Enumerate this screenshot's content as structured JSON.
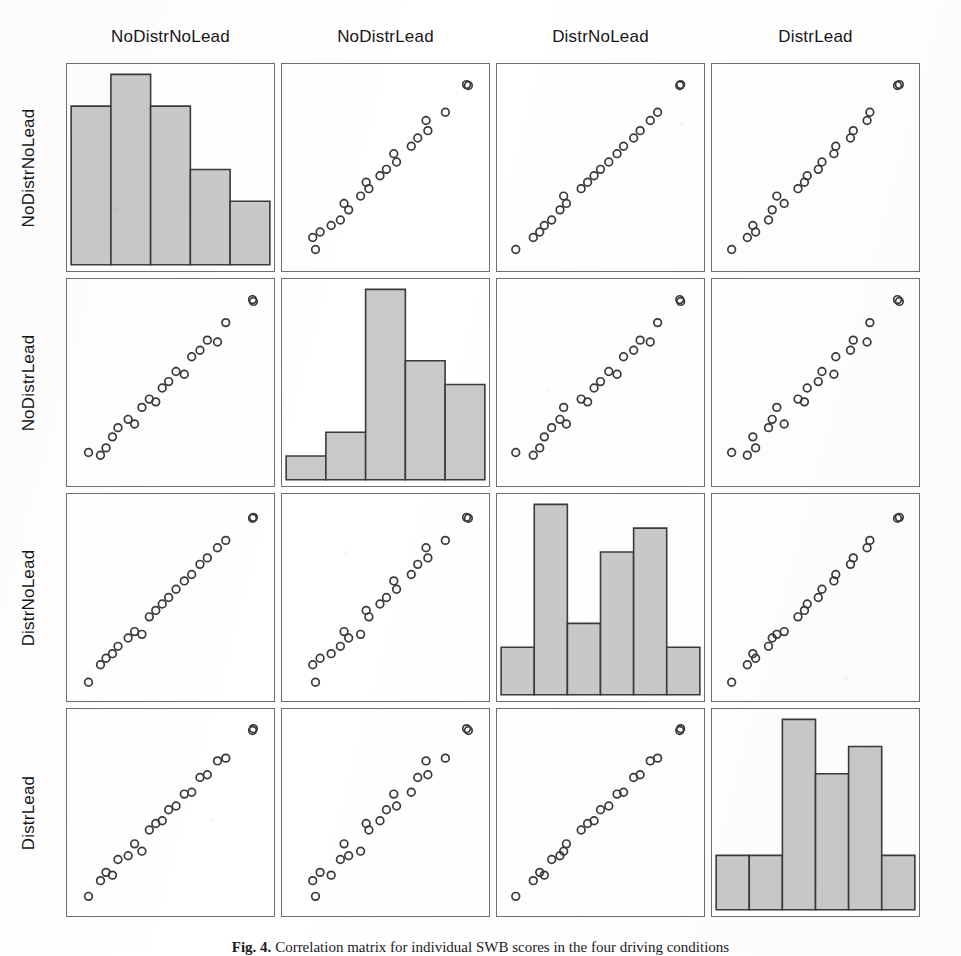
{
  "figure": {
    "caption_label": "Fig. 4.",
    "caption_text": "Correlation matrix for individual SWB scores in the four driving conditions",
    "variables": [
      "NoDistrNoLead",
      "NoDistrLead",
      "DistrNoLead",
      "DistrLead"
    ],
    "colors": {
      "bar_fill": "#c9c9c9",
      "bar_stroke": "#3b3b3b",
      "marker_stroke": "#3a3a3a",
      "panel_border": "#6f6f6f",
      "background": "#ffffff",
      "text": "#161616"
    }
  },
  "column_headers": [
    {
      "label": "NoDistrNoLead"
    },
    {
      "label": "NoDistrLead"
    },
    {
      "label": "DistrNoLead"
    },
    {
      "label": "DistrLead"
    }
  ],
  "row_headers": [
    {
      "label": "NoDistrNoLead"
    },
    {
      "label": "NoDistrLead"
    },
    {
      "label": "DistrNoLead"
    },
    {
      "label": "DistrLead"
    }
  ],
  "chart_data": {
    "type": "scatter",
    "subtype": "scatterplot-matrix",
    "title": "Correlation matrix for individual SWB scores in the four driving conditions",
    "xlabel": "",
    "ylabel": "",
    "grid": false,
    "legend": "none",
    "n_rows": 4,
    "n_cols": 4,
    "diagonal": "histogram",
    "n_observations": 21,
    "variables": [
      "NoDistrNoLead",
      "NoDistrLead",
      "DistrNoLead",
      "DistrLead"
    ],
    "axis_range": [
      0,
      1
    ],
    "observations": [
      {
        "NoDistrNoLead": 0.055,
        "NoDistrLead": 0.12,
        "DistrNoLead": 0.04,
        "DistrLead": 0.045
      },
      {
        "NoDistrNoLead": 0.12,
        "NoDistrLead": 0.105,
        "DistrNoLead": 0.135,
        "DistrLead": 0.13
      },
      {
        "NoDistrNoLead": 0.15,
        "NoDistrLead": 0.145,
        "DistrNoLead": 0.17,
        "DistrLead": 0.175
      },
      {
        "NoDistrNoLead": 0.185,
        "NoDistrLead": 0.205,
        "DistrNoLead": 0.195,
        "DistrLead": 0.16
      },
      {
        "NoDistrNoLead": 0.215,
        "NoDistrLead": 0.255,
        "DistrNoLead": 0.235,
        "DistrLead": 0.245
      },
      {
        "NoDistrNoLead": 0.27,
        "NoDistrLead": 0.3,
        "DistrNoLead": 0.28,
        "DistrLead": 0.265
      },
      {
        "NoDistrNoLead": 0.305,
        "NoDistrLead": 0.275,
        "DistrNoLead": 0.315,
        "DistrLead": 0.33
      },
      {
        "NoDistrNoLead": 0.345,
        "NoDistrLead": 0.365,
        "DistrNoLead": 0.3,
        "DistrLead": 0.29
      },
      {
        "NoDistrNoLead": 0.385,
        "NoDistrLead": 0.41,
        "DistrNoLead": 0.395,
        "DistrLead": 0.405
      },
      {
        "NoDistrNoLead": 0.42,
        "NoDistrLead": 0.395,
        "DistrNoLead": 0.43,
        "DistrLead": 0.44
      },
      {
        "NoDistrNoLead": 0.455,
        "NoDistrLead": 0.47,
        "DistrNoLead": 0.465,
        "DistrLead": 0.455
      },
      {
        "NoDistrNoLead": 0.49,
        "NoDistrLead": 0.505,
        "DistrNoLead": 0.5,
        "DistrLead": 0.515
      },
      {
        "NoDistrNoLead": 0.53,
        "NoDistrLead": 0.56,
        "DistrNoLead": 0.545,
        "DistrLead": 0.535
      },
      {
        "NoDistrNoLead": 0.575,
        "NoDistrLead": 0.545,
        "DistrNoLead": 0.59,
        "DistrLead": 0.6
      },
      {
        "NoDistrNoLead": 0.615,
        "NoDistrLead": 0.64,
        "DistrNoLead": 0.625,
        "DistrLead": 0.61
      },
      {
        "NoDistrNoLead": 0.66,
        "NoDistrLead": 0.675,
        "DistrNoLead": 0.68,
        "DistrLead": 0.69
      },
      {
        "NoDistrNoLead": 0.7,
        "NoDistrLead": 0.73,
        "DistrNoLead": 0.715,
        "DistrLead": 0.705
      },
      {
        "NoDistrNoLead": 0.755,
        "NoDistrLead": 0.72,
        "DistrNoLead": 0.77,
        "DistrLead": 0.78
      },
      {
        "NoDistrNoLead": 0.8,
        "NoDistrLead": 0.825,
        "DistrNoLead": 0.81,
        "DistrLead": 0.795
      },
      {
        "NoDistrNoLead": 0.945,
        "NoDistrLead": 0.95,
        "DistrNoLead": 0.93,
        "DistrLead": 0.945
      },
      {
        "NoDistrNoLead": 0.95,
        "NoDistrLead": 0.94,
        "DistrNoLead": 0.935,
        "DistrLead": 0.955
      }
    ],
    "histograms": [
      {
        "variable": "NoDistrNoLead",
        "bin_edges": [
          0.0,
          0.2,
          0.4,
          0.6,
          0.8,
          1.0
        ],
        "counts": [
          5,
          6,
          5,
          3,
          2
        ],
        "max_count": 6
      },
      {
        "variable": "NoDistrLead",
        "bin_edges": [
          0.0,
          0.2,
          0.4,
          0.6,
          0.8,
          1.0
        ],
        "counts": [
          1,
          2,
          8,
          5,
          4
        ],
        "max_count": 8
      },
      {
        "variable": "DistrNoLead",
        "bin_edges": [
          0.0,
          0.1667,
          0.3333,
          0.5,
          0.6667,
          0.8333,
          1.0
        ],
        "counts": [
          2,
          8,
          3,
          6,
          7,
          2
        ],
        "max_count": 8
      },
      {
        "variable": "DistrLead",
        "bin_edges": [
          0.0,
          0.1667,
          0.3333,
          0.5,
          0.6667,
          0.8333,
          1.0
        ],
        "counts": [
          2,
          2,
          7,
          5,
          6,
          2
        ],
        "max_count": 7
      }
    ]
  }
}
